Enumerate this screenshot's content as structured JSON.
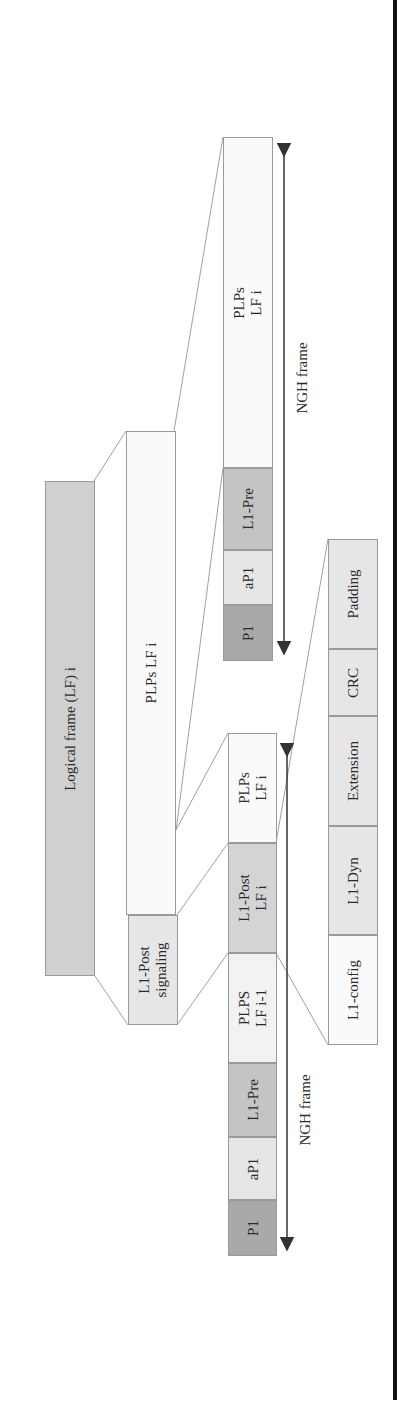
{
  "diagram": {
    "logical_frame": {
      "label": "Logical frame (LF) i"
    },
    "lf_content": {
      "l1_post_signaling": {
        "line1": "L1-Post",
        "line2": "signaling"
      },
      "plps_lf_i": {
        "label": "PLPs LF i"
      }
    },
    "ngh_frame_top": {
      "arrow_label": "NGH frame",
      "blocks": [
        {
          "name": "P1",
          "label": "P1"
        },
        {
          "name": "aP1",
          "label": "aP1"
        },
        {
          "name": "L1-Pre",
          "label": "L1-Pre"
        },
        {
          "name": "PLPs",
          "line1": "PLPs",
          "line2": "LF i"
        }
      ]
    },
    "ngh_frame_bottom": {
      "arrow_label": "NGH frame",
      "blocks": [
        {
          "name": "P1",
          "label": "P1"
        },
        {
          "name": "aP1",
          "label": "aP1"
        },
        {
          "name": "L1-Pre",
          "label": "L1-Pre"
        },
        {
          "name": "PLPS-prev",
          "line1": "PLPS",
          "line2": "LF i-1"
        },
        {
          "name": "L1-Post",
          "line1": "L1-Post",
          "line2": "LF i"
        },
        {
          "name": "PLPs",
          "line1": "PLPs",
          "line2": "LF i"
        }
      ]
    },
    "l1_post_breakdown": {
      "blocks": [
        {
          "name": "L1-config",
          "label": "L1-config"
        },
        {
          "name": "L1-Dyn",
          "label": "L1-Dyn"
        },
        {
          "name": "Extension",
          "label": "Extension"
        },
        {
          "name": "CRC",
          "label": "CRC"
        },
        {
          "name": "Padding",
          "label": "Padding"
        }
      ]
    },
    "colors": {
      "dark_gray": "#a9a9a9",
      "mid_gray": "#c4c4c4",
      "light_gray": "#e6e6e6",
      "white_box": "#fafafa",
      "logical_frame": "#d0d0d0",
      "border": "#9a9a9a",
      "rule": "#111111"
    }
  }
}
